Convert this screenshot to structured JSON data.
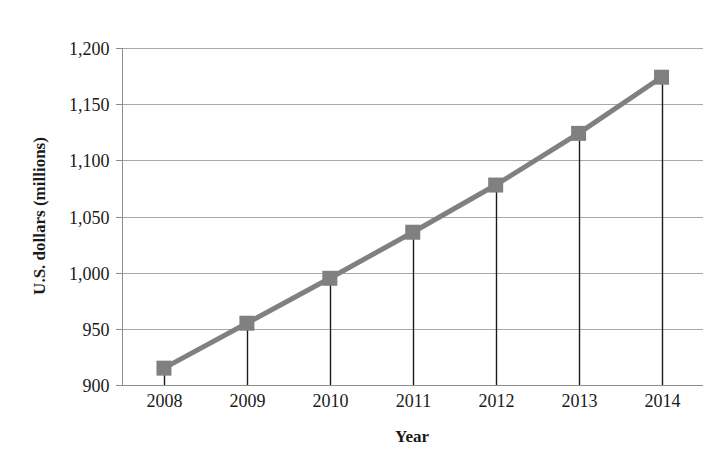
{
  "chart_data": {
    "type": "line",
    "title": "",
    "xlabel": "Year",
    "ylabel": "U.S. dollars (millions)",
    "categories": [
      "2008",
      "2009",
      "2010",
      "2011",
      "2012",
      "2013",
      "2014"
    ],
    "values": [
      915,
      955,
      995,
      1036,
      1078,
      1124,
      1174
    ],
    "series": [
      {
        "name": "U.S. dollars (millions)",
        "values": [
          915,
          955,
          995,
          1036,
          1078,
          1124,
          1174
        ]
      }
    ],
    "ylim": [
      900,
      1200
    ],
    "xlim": [
      "2008",
      "2014"
    ],
    "ytick_labels": [
      "900",
      "950",
      "1,000",
      "1,050",
      "1,100",
      "1,150",
      "1,200"
    ],
    "ytick_values": [
      900,
      950,
      1000,
      1050,
      1100,
      1150,
      1200
    ],
    "xtick_labels": [
      "2008",
      "2009",
      "2010",
      "2011",
      "2012",
      "2013",
      "2014"
    ],
    "grid": "horizontal",
    "legend": "none",
    "marker": "square",
    "series_color": "#808080",
    "dropline_color": "#1a1a1a",
    "gridline_color": "#a8a8a8",
    "background_color": "#ffffff",
    "annotations": []
  }
}
